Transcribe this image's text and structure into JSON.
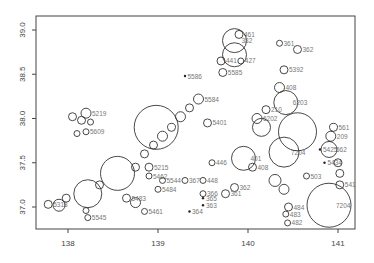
{
  "chart_data": {
    "type": "scatter",
    "subtype": "bubble",
    "title": "",
    "xlabel": "",
    "ylabel": "",
    "xlim": [
      137.65,
      141.2
    ],
    "ylim": [
      36.75,
      39.15
    ],
    "grid": false,
    "legend": null,
    "x_ticks": [
      "138",
      "139",
      "140",
      "141"
    ],
    "y_ticks": [
      "37.0",
      "37.5",
      "38.0",
      "38.5",
      "39.0"
    ],
    "x_tick_values": [
      138,
      139,
      140,
      141
    ],
    "y_tick_values": [
      37.0,
      37.5,
      38.0,
      38.5,
      39.0
    ],
    "points": [
      {
        "lon": 137.78,
        "lat": 37.03,
        "r": 4,
        "label": "5318"
      },
      {
        "lon": 137.9,
        "lat": 37.02,
        "r": 6,
        "label": ""
      },
      {
        "lon": 137.98,
        "lat": 37.1,
        "r": 4,
        "label": ""
      },
      {
        "lon": 138.22,
        "lat": 37.15,
        "r": 14,
        "label": ""
      },
      {
        "lon": 138.2,
        "lat": 36.96,
        "r": 3,
        "label": ""
      },
      {
        "lon": 138.22,
        "lat": 36.88,
        "r": 3,
        "label": "5545"
      },
      {
        "lon": 138.35,
        "lat": 37.25,
        "r": 4,
        "label": ""
      },
      {
        "lon": 138.55,
        "lat": 37.38,
        "r": 17,
        "label": ""
      },
      {
        "lon": 138.05,
        "lat": 38.02,
        "r": 4,
        "label": ""
      },
      {
        "lon": 138.2,
        "lat": 38.06,
        "r": 5,
        "label": "5219"
      },
      {
        "lon": 138.15,
        "lat": 37.98,
        "r": 4,
        "label": ""
      },
      {
        "lon": 138.25,
        "lat": 37.96,
        "r": 3,
        "label": ""
      },
      {
        "lon": 138.2,
        "lat": 37.85,
        "r": 3,
        "label": "5609"
      },
      {
        "lon": 138.1,
        "lat": 37.83,
        "r": 3,
        "label": ""
      },
      {
        "lon": 138.98,
        "lat": 37.9,
        "r": 22,
        "label": ""
      },
      {
        "lon": 138.75,
        "lat": 37.45,
        "r": 4,
        "label": ""
      },
      {
        "lon": 138.85,
        "lat": 37.6,
        "r": 4,
        "label": ""
      },
      {
        "lon": 138.95,
        "lat": 37.7,
        "r": 4,
        "label": ""
      },
      {
        "lon": 139.05,
        "lat": 37.8,
        "r": 5,
        "label": ""
      },
      {
        "lon": 139.15,
        "lat": 37.9,
        "r": 4,
        "label": ""
      },
      {
        "lon": 139.25,
        "lat": 38.02,
        "r": 5,
        "label": ""
      },
      {
        "lon": 139.35,
        "lat": 38.12,
        "r": 4,
        "label": ""
      },
      {
        "lon": 139.45,
        "lat": 38.22,
        "r": 5,
        "label": "5584"
      },
      {
        "lon": 138.9,
        "lat": 37.45,
        "r": 4,
        "label": "5215"
      },
      {
        "lon": 138.9,
        "lat": 37.35,
        "r": 3,
        "label": "5462"
      },
      {
        "lon": 139.0,
        "lat": 37.2,
        "r": 3,
        "label": "5484"
      },
      {
        "lon": 138.85,
        "lat": 36.95,
        "r": 3,
        "label": "5461"
      },
      {
        "lon": 138.75,
        "lat": 37.05,
        "r": 5,
        "label": ""
      },
      {
        "lon": 138.65,
        "lat": 37.1,
        "r": 4,
        "label": "5483"
      },
      {
        "lon": 139.05,
        "lat": 37.3,
        "r": 3,
        "label": "5544"
      },
      {
        "lon": 139.3,
        "lat": 37.3,
        "r": 3,
        "label": "367"
      },
      {
        "lon": 139.55,
        "lat": 37.95,
        "r": 4,
        "label": "5401"
      },
      {
        "lon": 139.3,
        "lat": 38.48,
        "r": 1.5,
        "label": "5586"
      },
      {
        "lon": 139.72,
        "lat": 38.52,
        "r": 4,
        "label": "5585"
      },
      {
        "lon": 139.7,
        "lat": 38.65,
        "r": 4,
        "label": "441"
      },
      {
        "lon": 139.92,
        "lat": 38.65,
        "r": 3,
        "label": "427"
      },
      {
        "lon": 139.9,
        "lat": 38.95,
        "r": 4,
        "label": "461"
      },
      {
        "lon": 139.85,
        "lat": 38.88,
        "r": 12,
        "label": "382"
      },
      {
        "lon": 139.85,
        "lat": 38.72,
        "r": 12,
        "label": ""
      },
      {
        "lon": 140.35,
        "lat": 38.85,
        "r": 3,
        "label": "361"
      },
      {
        "lon": 140.55,
        "lat": 38.78,
        "r": 4,
        "label": "362"
      },
      {
        "lon": 140.4,
        "lat": 38.55,
        "r": 4,
        "label": "5392"
      },
      {
        "lon": 140.35,
        "lat": 38.35,
        "r": 5,
        "label": "408"
      },
      {
        "lon": 140.42,
        "lat": 38.18,
        "r": 12,
        "label": "6203"
      },
      {
        "lon": 140.2,
        "lat": 38.1,
        "r": 4,
        "label": "210"
      },
      {
        "lon": 140.1,
        "lat": 38.0,
        "r": 5,
        "label": "6202"
      },
      {
        "lon": 140.15,
        "lat": 37.9,
        "r": 9,
        "label": ""
      },
      {
        "lon": 139.95,
        "lat": 37.55,
        "r": 12,
        "label": "401"
      },
      {
        "lon": 140.05,
        "lat": 37.45,
        "r": 4,
        "label": "408"
      },
      {
        "lon": 139.6,
        "lat": 37.5,
        "r": 3,
        "label": "446"
      },
      {
        "lon": 139.5,
        "lat": 37.3,
        "r": 3,
        "label": "448"
      },
      {
        "lon": 139.85,
        "lat": 37.22,
        "r": 4,
        "label": "362"
      },
      {
        "lon": 139.75,
        "lat": 37.15,
        "r": 4,
        "label": "361"
      },
      {
        "lon": 139.5,
        "lat": 37.15,
        "r": 3,
        "label": "366"
      },
      {
        "lon": 139.5,
        "lat": 37.1,
        "r": 2,
        "label": "365"
      },
      {
        "lon": 139.5,
        "lat": 37.02,
        "r": 2,
        "label": "363"
      },
      {
        "lon": 139.35,
        "lat": 36.95,
        "r": 1.5,
        "label": "364"
      },
      {
        "lon": 140.4,
        "lat": 37.62,
        "r": 15,
        "label": "7204"
      },
      {
        "lon": 140.55,
        "lat": 37.85,
        "r": 19,
        "label": ""
      },
      {
        "lon": 140.3,
        "lat": 37.3,
        "r": 6,
        "label": ""
      },
      {
        "lon": 140.4,
        "lat": 37.2,
        "r": 5,
        "label": ""
      },
      {
        "lon": 140.45,
        "lat": 37.0,
        "r": 4,
        "label": "484"
      },
      {
        "lon": 140.42,
        "lat": 36.92,
        "r": 3,
        "label": "483"
      },
      {
        "lon": 140.44,
        "lat": 36.82,
        "r": 3,
        "label": "482"
      },
      {
        "lon": 140.65,
        "lat": 37.35,
        "r": 3,
        "label": "503"
      },
      {
        "lon": 140.8,
        "lat": 37.65,
        "r": 2,
        "label": "5425"
      },
      {
        "lon": 140.85,
        "lat": 37.5,
        "r": 2,
        "label": "5434"
      },
      {
        "lon": 140.9,
        "lat": 37.02,
        "r": 22,
        "label": "7204"
      },
      {
        "lon": 140.95,
        "lat": 37.9,
        "r": 4,
        "label": "561"
      },
      {
        "lon": 140.92,
        "lat": 37.8,
        "r": 5,
        "label": "209"
      },
      {
        "lon": 140.9,
        "lat": 37.65,
        "r": 8,
        "label": "562"
      },
      {
        "lon": 141.0,
        "lat": 37.5,
        "r": 4,
        "label": ""
      },
      {
        "lon": 141.02,
        "lat": 37.38,
        "r": 4,
        "label": ""
      },
      {
        "lon": 141.02,
        "lat": 37.25,
        "r": 4,
        "label": "541"
      }
    ]
  }
}
